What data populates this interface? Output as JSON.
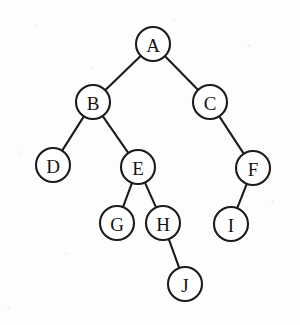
{
  "diagram": {
    "type": "binary-tree",
    "background_color": "#fdfdfe",
    "stroke_color": "#1b1b1b",
    "node_fill_color": "#ffffff",
    "node_radius": 17,
    "nodes": [
      {
        "id": "A",
        "label": "A",
        "cx": 153,
        "cy": 44,
        "r": 17
      },
      {
        "id": "B",
        "label": "B",
        "cx": 93,
        "cy": 102,
        "r": 17
      },
      {
        "id": "C",
        "label": "C",
        "cx": 210,
        "cy": 102,
        "r": 17
      },
      {
        "id": "D",
        "label": "D",
        "cx": 53,
        "cy": 165,
        "r": 17
      },
      {
        "id": "E",
        "label": "E",
        "cx": 138,
        "cy": 167,
        "r": 17
      },
      {
        "id": "F",
        "label": "F",
        "cx": 253,
        "cy": 168,
        "r": 17
      },
      {
        "id": "G",
        "label": "G",
        "cx": 117,
        "cy": 223,
        "r": 17
      },
      {
        "id": "H",
        "label": "H",
        "cx": 163,
        "cy": 223,
        "r": 17
      },
      {
        "id": "I",
        "label": "I",
        "cx": 231,
        "cy": 224,
        "r": 17
      },
      {
        "id": "J",
        "label": "J",
        "cx": 185,
        "cy": 284,
        "r": 17
      }
    ],
    "edges": [
      {
        "from": "A",
        "to": "B"
      },
      {
        "from": "A",
        "to": "C"
      },
      {
        "from": "B",
        "to": "D"
      },
      {
        "from": "B",
        "to": "E"
      },
      {
        "from": "C",
        "to": "F"
      },
      {
        "from": "E",
        "to": "G"
      },
      {
        "from": "E",
        "to": "H"
      },
      {
        "from": "F",
        "to": "I"
      },
      {
        "from": "H",
        "to": "J"
      }
    ]
  }
}
